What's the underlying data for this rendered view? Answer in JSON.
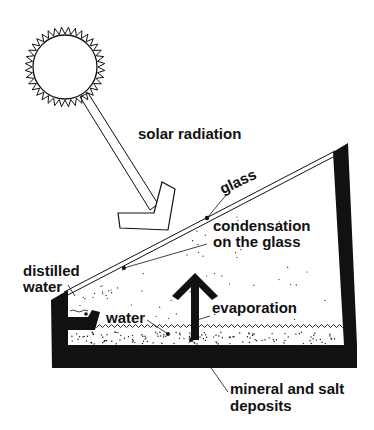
{
  "diagram": {
    "labels": {
      "solar_radiation": "solar radiation",
      "glass": "glass",
      "condensation_line1": "condensation",
      "condensation_line2": "on the glass",
      "distilled_line1": "distilled",
      "distilled_line2": "water",
      "water": "water",
      "evaporation": "evaporation",
      "deposits_line1": "mineral and salt",
      "deposits_line2": "deposits"
    },
    "colors": {
      "ink": "#111111",
      "background": "#ffffff"
    }
  }
}
